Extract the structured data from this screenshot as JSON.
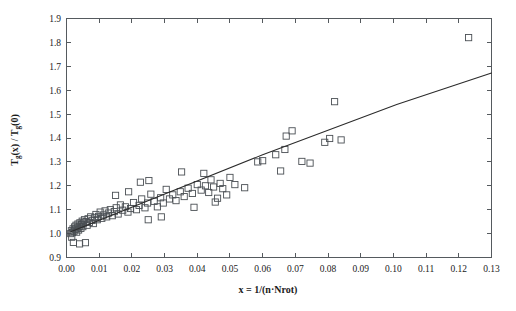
{
  "chart_data": {
    "type": "scatter",
    "title": "",
    "subtitle": "",
    "xlabel": "x = 1/(n·Nrot)",
    "ylabel": "Tg(x) / Tg(0)",
    "ylabel_parts": {
      "base1": "T",
      "sub1": "g",
      "mid": "(x) / ",
      "base2": "T",
      "sub2": "g",
      "tail": "(0)"
    },
    "xlabel_parts": {
      "lead": "x = 1/(n",
      "dot": "·",
      "tail": "Nrot)"
    },
    "xlim": [
      0.0,
      0.13
    ],
    "ylim": [
      0.9,
      1.9
    ],
    "grid": false,
    "legend": false,
    "legend_position": "none",
    "marker_style": "open-square",
    "marker_size_px": 6.2,
    "xticks": [
      0.0,
      0.01,
      0.02,
      0.03,
      0.04,
      0.05,
      0.06,
      0.07,
      0.08,
      0.09,
      0.1,
      0.11,
      0.12,
      0.13
    ],
    "xtick_labels": [
      "0.00",
      "0.01",
      "0.02",
      "0.03",
      "0.04",
      "0.05",
      "0.06",
      "0.07",
      "0.08",
      "0.09",
      "0.10",
      "0.11",
      "0.12",
      "0.13"
    ],
    "yticks": [
      0.9,
      1.0,
      1.1,
      1.2,
      1.3,
      1.4,
      1.5,
      1.6,
      1.7,
      1.8,
      1.9
    ],
    "ytick_labels": [
      "0.9",
      "1.0",
      "1.1",
      "1.2",
      "1.3",
      "1.4",
      "1.5",
      "1.6",
      "1.7",
      "1.8",
      "1.9"
    ],
    "series": [
      {
        "name": "Tg ratio data",
        "type": "scatter",
        "points": [
          [
            0.0013,
            1.0
          ],
          [
            0.0015,
            1.012
          ],
          [
            0.0016,
            0.985
          ],
          [
            0.0018,
            1.004
          ],
          [
            0.002,
            1.02
          ],
          [
            0.0021,
            0.963
          ],
          [
            0.0023,
            1.01
          ],
          [
            0.0025,
            1.028
          ],
          [
            0.0027,
            1.018
          ],
          [
            0.0029,
            1.035
          ],
          [
            0.0031,
            1.006
          ],
          [
            0.0033,
            1.024
          ],
          [
            0.0035,
            1.04
          ],
          [
            0.0037,
            1.015
          ],
          [
            0.0039,
            1.03
          ],
          [
            0.0041,
            1.045
          ],
          [
            0.0044,
            1.022
          ],
          [
            0.0046,
            1.038
          ],
          [
            0.0048,
            1.052
          ],
          [
            0.005,
            1.029
          ],
          [
            0.0052,
            1.044
          ],
          [
            0.0055,
            1.058
          ],
          [
            0.004,
            0.957
          ],
          [
            0.0058,
            0.962
          ],
          [
            0.006,
            1.05
          ],
          [
            0.0063,
            1.035
          ],
          [
            0.0066,
            1.062
          ],
          [
            0.007,
            1.047
          ],
          [
            0.0074,
            1.07
          ],
          [
            0.0078,
            1.055
          ],
          [
            0.0082,
            1.042
          ],
          [
            0.0086,
            1.066
          ],
          [
            0.009,
            1.08
          ],
          [
            0.0094,
            1.058
          ],
          [
            0.0098,
            1.072
          ],
          [
            0.0103,
            1.09
          ],
          [
            0.0108,
            1.064
          ],
          [
            0.0113,
            1.078
          ],
          [
            0.0118,
            1.095
          ],
          [
            0.0123,
            1.07
          ],
          [
            0.0128,
            1.086
          ],
          [
            0.0134,
            1.1
          ],
          [
            0.014,
            1.075
          ],
          [
            0.0146,
            1.092
          ],
          [
            0.0152,
            1.108
          ],
          [
            0.0158,
            1.082
          ],
          [
            0.015,
            1.16
          ],
          [
            0.0165,
            1.12
          ],
          [
            0.0172,
            1.098
          ],
          [
            0.018,
            1.112
          ],
          [
            0.0188,
            1.09
          ],
          [
            0.0196,
            1.105
          ],
          [
            0.019,
            1.175
          ],
          [
            0.0205,
            1.13
          ],
          [
            0.0214,
            1.1
          ],
          [
            0.0222,
            1.118
          ],
          [
            0.023,
            1.145
          ],
          [
            0.0226,
            1.215
          ],
          [
            0.024,
            1.108
          ],
          [
            0.0248,
            1.128
          ],
          [
            0.025,
            1.058
          ],
          [
            0.0258,
            1.165
          ],
          [
            0.0252,
            1.222
          ],
          [
            0.0268,
            1.135
          ],
          [
            0.0278,
            1.112
          ],
          [
            0.0288,
            1.15
          ],
          [
            0.0296,
            1.128
          ],
          [
            0.029,
            1.07
          ],
          [
            0.0305,
            1.185
          ],
          [
            0.0315,
            1.145
          ],
          [
            0.0325,
            1.162
          ],
          [
            0.0335,
            1.138
          ],
          [
            0.0348,
            1.175
          ],
          [
            0.0352,
            1.258
          ],
          [
            0.036,
            1.155
          ],
          [
            0.0372,
            1.19
          ],
          [
            0.0385,
            1.168
          ],
          [
            0.039,
            1.11
          ],
          [
            0.04,
            1.205
          ],
          [
            0.0412,
            1.182
          ],
          [
            0.042,
            1.252
          ],
          [
            0.0425,
            1.2
          ],
          [
            0.0435,
            1.172
          ],
          [
            0.0442,
            1.225
          ],
          [
            0.045,
            1.195
          ],
          [
            0.0455,
            1.132
          ],
          [
            0.0462,
            1.148
          ],
          [
            0.047,
            1.21
          ],
          [
            0.0478,
            1.188
          ],
          [
            0.049,
            1.162
          ],
          [
            0.05,
            1.235
          ],
          [
            0.0515,
            1.205
          ],
          [
            0.0545,
            1.192
          ],
          [
            0.0585,
            1.3
          ],
          [
            0.06,
            1.305
          ],
          [
            0.064,
            1.33
          ],
          [
            0.0655,
            1.262
          ],
          [
            0.0668,
            1.352
          ],
          [
            0.0672,
            1.408
          ],
          [
            0.069,
            1.43
          ],
          [
            0.072,
            1.302
          ],
          [
            0.0745,
            1.295
          ],
          [
            0.079,
            1.382
          ],
          [
            0.0805,
            1.398
          ],
          [
            0.082,
            1.552
          ],
          [
            0.084,
            1.392
          ],
          [
            0.123,
            1.82
          ]
        ]
      },
      {
        "name": "fit line",
        "type": "line",
        "points": [
          [
            0.0013,
            1.008
          ],
          [
            0.06,
            1.33
          ],
          [
            0.101,
            1.54
          ],
          [
            0.13,
            1.672
          ]
        ]
      }
    ],
    "annotations": []
  },
  "colors": {
    "axis": "#555a5e",
    "marker_stroke": "#4a4f54",
    "line": "#2b2b2b",
    "text": "#1b1b1b",
    "background": "#ffffff"
  }
}
